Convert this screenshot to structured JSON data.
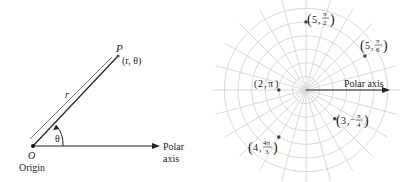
{
  "left_diagram": {
    "point_label": "P",
    "point_coords": "(r, θ)",
    "radius_label": "r",
    "angle_label": "θ",
    "origin_letter": "O",
    "origin_label": "Origin",
    "axis_label_line1": "Polar",
    "axis_label_line2": "axis"
  },
  "right_diagram": {
    "axis_label": "Polar axis",
    "points": [
      {
        "label_r": "5",
        "label_theta_num": "π",
        "label_theta_den": "2"
      },
      {
        "label_r": "5",
        "label_theta_num": "π",
        "label_theta_den": "6"
      },
      {
        "label_r": "2",
        "label_theta": "π"
      },
      {
        "label_r": "3",
        "label_theta_num": "π",
        "label_theta_den": "4",
        "sign": "−"
      },
      {
        "label_r": "4",
        "label_theta_num": "4π",
        "label_theta_den": "3"
      }
    ]
  },
  "colors": {
    "ink": "#222222",
    "grid": "#c8c8c8",
    "point": "#555555"
  }
}
